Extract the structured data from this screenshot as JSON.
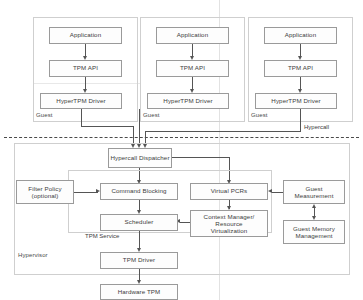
{
  "diagram": {
    "guests": [
      {
        "zone_label": "Guest",
        "application": "Application",
        "tpm_api": "TPM API",
        "driver": "HyperTPM Driver"
      },
      {
        "zone_label": "Guest",
        "application": "Application",
        "tpm_api": "TPM API",
        "driver": "HyperTPM Driver"
      },
      {
        "zone_label": "Guest",
        "application": "Application",
        "tpm_api": "TPM API",
        "driver": "HyperTPM Driver"
      }
    ],
    "boundary_label": "Hypercall",
    "hypervisor": {
      "zone_label": "Hypervisor",
      "dispatcher": "Hypercall Dispatcher",
      "filter_policy": "Filter Policy (optional)",
      "filter_policy_line1": "Filter Policy",
      "filter_policy_line2": "(optional)",
      "command_blocking": "Command Blocking",
      "virtual_pcrs": "Virtual PCRs",
      "guest_measurement_line1": "Guest",
      "guest_measurement_line2": "Measurement",
      "context_manager_line1": "Context Manager/",
      "context_manager_line2": "Resource",
      "context_manager_line3": "Virtualization",
      "scheduler": "Scheduler",
      "tpm_service_label": "TPM Service",
      "guest_memory_line1": "Guest Memory",
      "guest_memory_line2": "Management",
      "tpm_driver": "TPM Driver",
      "hardware_tpm": "Hardware TPM"
    },
    "colors": {
      "box_border": "#9a9a9a",
      "container_border": "#cfcfcf",
      "connector": "#555555",
      "divider": "#4a4a4a",
      "text": "#3c3c3c"
    }
  }
}
